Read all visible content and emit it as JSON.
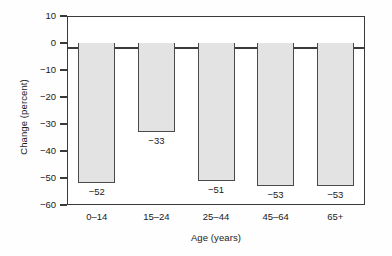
{
  "chart_data": {
    "type": "bar",
    "title": "",
    "subtitle": "",
    "categories": [
      "0–14",
      "15–24",
      "25–44",
      "45–64",
      "65+"
    ],
    "values": [
      -52,
      -33,
      -51,
      -53,
      -53
    ],
    "value_labels": [
      "−52",
      "−33",
      "−51",
      "−53",
      "−53"
    ],
    "xlabel": "Age (years)",
    "ylabel": "Change (percent)",
    "ylim": [
      -60,
      10
    ],
    "ytick_values": [
      10,
      0,
      -10,
      -20,
      -30,
      -40,
      -50,
      -60
    ],
    "ytick_labels": [
      "10",
      "0",
      "−10",
      "−20",
      "−30",
      "−40",
      "−50",
      "−60"
    ],
    "grid": false,
    "legend": null,
    "legend_position": "none",
    "orientation": "vertical",
    "bar_fill_color": "#e3e3e3",
    "bar_edge_color": "#4a4a4a",
    "axis_color": "#3a3a3a",
    "background_color": "#ffffff",
    "value_label_position": "below-bar-end",
    "annotations": []
  }
}
